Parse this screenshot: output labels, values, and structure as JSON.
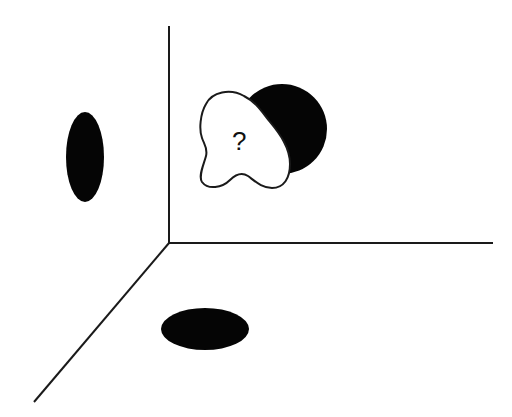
{
  "diagram": {
    "type": "3d-projection-puzzle",
    "colors": {
      "line": "#1a1a1a",
      "shape_fill": "#050505",
      "blob_fill": "#ffffff",
      "background": "#ffffff"
    },
    "axes": {
      "origin": [
        169,
        243
      ],
      "vertical_end": [
        169,
        26
      ],
      "horizontal_end": [
        493,
        243
      ],
      "diagonal_end": [
        34,
        402
      ]
    },
    "projections": {
      "left_wall": {
        "shape": "ellipse",
        "cx": 85,
        "cy": 157,
        "rx": 19,
        "ry": 45
      },
      "floor": {
        "shape": "ellipse",
        "cx": 205,
        "cy": 329,
        "rx": 44,
        "ry": 21
      },
      "back_wall": {
        "shape": "circle",
        "cx": 282,
        "cy": 129,
        "r": 45
      }
    },
    "unknown_object": {
      "label": "?"
    }
  }
}
